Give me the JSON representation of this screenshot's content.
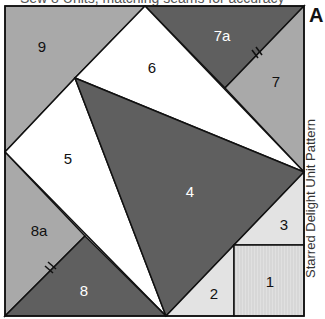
{
  "header": {
    "cropped_caption": "Sew 8 Units, matching seams for accuracy"
  },
  "figure": {
    "letter": "A",
    "side_label": "Starred Delight Unit Pattern"
  },
  "colors": {
    "dark": "#5f5f5f",
    "medium": "#a9a9a9",
    "light": "#e3e3e3",
    "white": "#ffffff",
    "line": "#111111"
  },
  "pieces": [
    {
      "id": "1",
      "label": "1",
      "fill": "light"
    },
    {
      "id": "2",
      "label": "2",
      "fill": "light"
    },
    {
      "id": "3",
      "label": "3",
      "fill": "light"
    },
    {
      "id": "4",
      "label": "4",
      "fill": "dark"
    },
    {
      "id": "5",
      "label": "5",
      "fill": "white"
    },
    {
      "id": "6",
      "label": "6",
      "fill": "white"
    },
    {
      "id": "7",
      "label": "7",
      "fill": "medium"
    },
    {
      "id": "7a",
      "label": "7a",
      "fill": "dark"
    },
    {
      "id": "8",
      "label": "8",
      "fill": "dark"
    },
    {
      "id": "8a",
      "label": "8a",
      "fill": "medium"
    },
    {
      "id": "9",
      "label": "9",
      "fill": "medium"
    }
  ]
}
